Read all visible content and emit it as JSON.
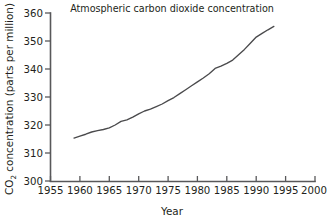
{
  "chart_data": {
    "type": "line",
    "title": "Atmospheric carbon dioxide concentration",
    "xlabel": "Year",
    "ylabel_main": "CO",
    "ylabel_sub": "2",
    "ylabel_rest": " concentration (parts per million)",
    "ylabel_full": "CO2 concentration (parts per million)",
    "xlim": [
      1955,
      2000
    ],
    "ylim": [
      300,
      360
    ],
    "xticks": [
      1955,
      1960,
      1965,
      1970,
      1975,
      1980,
      1985,
      1990,
      1995,
      2000
    ],
    "xtick_labels": [
      "1955",
      "1960",
      "1965",
      "1970",
      "1975",
      "1980",
      "1985",
      "1990",
      "1995",
      "2000"
    ],
    "yticks": [
      300,
      310,
      320,
      330,
      340,
      350,
      360
    ],
    "ytick_labels": [
      "300",
      "310",
      "320",
      "330",
      "340",
      "350",
      "360"
    ],
    "grid": false,
    "legend": false,
    "line_color": "#4a4a4c",
    "axis_color": "#58585a",
    "series": [
      {
        "name": "CO2 concentration",
        "x": [
          1959,
          1960,
          1961,
          1962,
          1963,
          1964,
          1965,
          1966,
          1967,
          1968,
          1969,
          1970,
          1971,
          1972,
          1973,
          1974,
          1975,
          1976,
          1977,
          1978,
          1979,
          1980,
          1981,
          1982,
          1983,
          1984,
          1985,
          1986,
          1987,
          1988,
          1989,
          1990,
          1991,
          1992,
          1993
        ],
        "values": [
          315.3,
          316.0,
          316.7,
          317.5,
          318.0,
          318.4,
          319.0,
          320.0,
          321.3,
          321.8,
          322.8,
          324.0,
          325.0,
          325.7,
          326.6,
          327.5,
          328.7,
          329.8,
          331.2,
          332.6,
          334.0,
          335.4,
          336.8,
          338.3,
          340.2,
          341.0,
          342.0,
          343.2,
          345.1,
          347.0,
          349.2,
          351.4,
          352.7,
          354.0,
          355.2
        ]
      }
    ]
  }
}
